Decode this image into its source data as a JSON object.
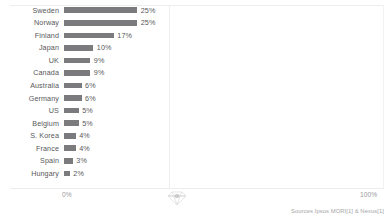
{
  "chart_data": {
    "type": "bar",
    "orientation": "horizontal",
    "title": "",
    "subtitle": "",
    "xlabel": "",
    "ylabel": "",
    "xlim": [
      0,
      100
    ],
    "grid": false,
    "legend": null,
    "axis_min_label": "0%",
    "axis_max_label": "100%",
    "bar_color": "#7b7b7d",
    "categories": [
      "Sweden",
      "Norway",
      "Finland",
      "Japan",
      "UK",
      "Canada",
      "Australia",
      "Germany",
      "US",
      "Belgium",
      "S. Korea",
      "France",
      "Spain",
      "Hungary"
    ],
    "values": [
      25,
      25,
      17,
      10,
      9,
      9,
      6,
      6,
      5,
      5,
      4,
      4,
      3,
      2
    ],
    "value_labels": [
      "25%",
      "25%",
      "17%",
      "10%",
      "9%",
      "9%",
      "6%",
      "6%",
      "5%",
      "5%",
      "4%",
      "4%",
      "3%",
      "2%"
    ]
  },
  "footer": {
    "source": "Sources Ipsos MORI[1] & Nexus[1]"
  },
  "icons": {
    "watermark": "diamond-icon"
  }
}
